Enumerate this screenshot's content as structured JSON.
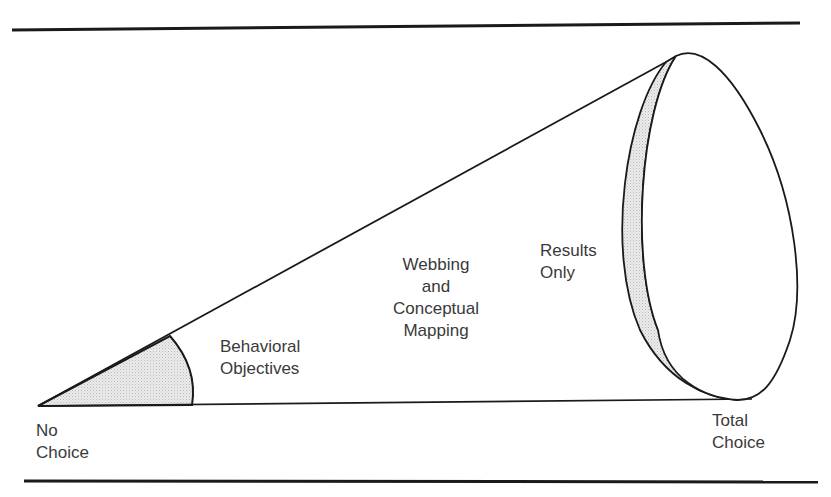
{
  "diagram": {
    "type": "cone-continuum",
    "endpoints": {
      "left": {
        "line1": "No",
        "line2": "Choice"
      },
      "right": {
        "line1": "Total",
        "line2": "Choice"
      }
    },
    "regions": [
      {
        "id": "behavioral",
        "line1": "Behavioral",
        "line2": "Objectives"
      },
      {
        "id": "webbing",
        "line1": "Webbing",
        "line2": "and",
        "line3": "Conceptual",
        "line4": "Mapping"
      },
      {
        "id": "results",
        "line1": "Results",
        "line2": "Only"
      }
    ],
    "colors": {
      "stroke": "#1a1a1a",
      "shade": "#e6e6e6",
      "text": "#3a3a3a"
    }
  }
}
